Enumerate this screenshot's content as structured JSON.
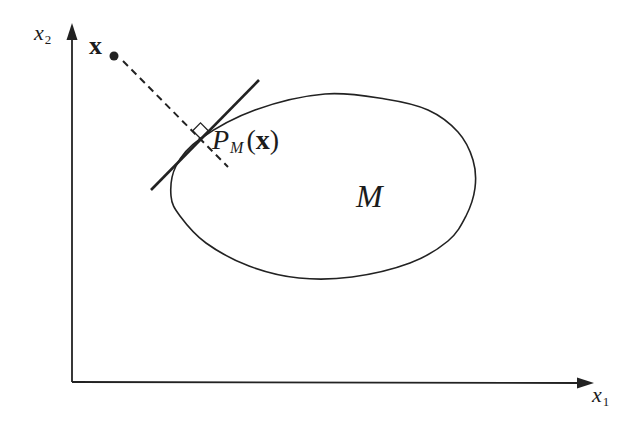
{
  "figure": {
    "background_color": "#ffffff",
    "ink_color": "#222222",
    "canvas": {
      "width": 635,
      "height": 425
    },
    "axes": {
      "origin": [
        72,
        382
      ],
      "x_axis": {
        "tip": [
          594,
          383
        ],
        "label": {
          "base": "x",
          "sub": "1"
        },
        "label_pos": [
          592,
          384
        ]
      },
      "y_axis": {
        "tip": [
          72,
          23
        ],
        "label": {
          "base": "x",
          "sub": "2"
        },
        "label_pos": [
          34,
          22
        ]
      }
    },
    "external_point": {
      "label": "x",
      "label_pos": [
        89,
        33
      ],
      "dot": [
        114,
        56
      ],
      "dot_radius": 4.5
    },
    "projection_segment": {
      "from": [
        123,
        61
      ],
      "to": [
        228,
        167
      ],
      "dash": [
        7,
        5
      ]
    },
    "supporting_line": {
      "from": [
        151,
        190
      ],
      "to": [
        259,
        80
      ]
    },
    "right_angle_marker": {
      "vertex": [
        200.5,
        138.5
      ],
      "size": 11
    },
    "projection_point_label": {
      "base": "P",
      "sub": "M",
      "open_paren": "(",
      "arg": "x",
      "close_paren": ")",
      "pos": [
        212,
        126
      ]
    },
    "set_label": {
      "text": "M",
      "pos": [
        356,
        180
      ]
    },
    "set_region_points": [
      [
        171,
        196
      ],
      [
        176,
        166
      ],
      [
        200,
        139
      ],
      [
        255,
        110
      ],
      [
        325,
        94
      ],
      [
        385,
        99
      ],
      [
        428,
        110
      ],
      [
        458,
        132
      ],
      [
        473,
        160
      ],
      [
        475,
        188
      ],
      [
        466,
        216
      ],
      [
        448,
        241
      ],
      [
        410,
        263
      ],
      [
        352,
        277
      ],
      [
        299,
        278
      ],
      [
        249,
        266
      ],
      [
        206,
        243
      ],
      [
        180,
        216
      ]
    ]
  }
}
